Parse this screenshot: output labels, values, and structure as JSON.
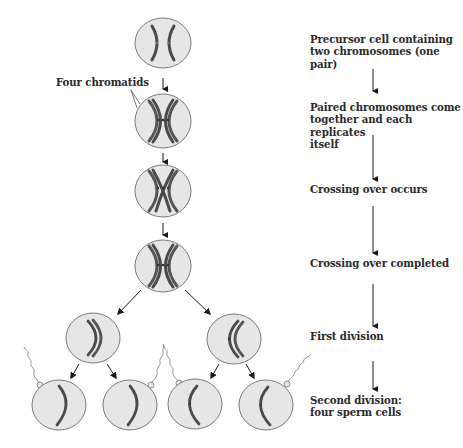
{
  "callout": {
    "label": "Four chromatids"
  },
  "steps": [
    {
      "label": "Precursor cell containing\ntwo chromosomes (one\npair)",
      "top": 33
    },
    {
      "label": "Paired chromosomes come\ntogether and each replicates\nitself",
      "top": 101
    },
    {
      "label": "Crossing over occurs",
      "top": 183
    },
    {
      "label": "Crossing over completed",
      "top": 257
    },
    {
      "label": "First division",
      "top": 330
    },
    {
      "label": "Second division:\nfour sperm cells",
      "top": 394
    }
  ],
  "colors": {
    "cell_fill": "#e6e6e6",
    "cell_stroke": "#7a7a7a",
    "chromosome": "#4a4a4a",
    "chromosome_light": "#6e6e6e",
    "arrow": "#1a1a1a",
    "text": "#2a2a2a"
  }
}
